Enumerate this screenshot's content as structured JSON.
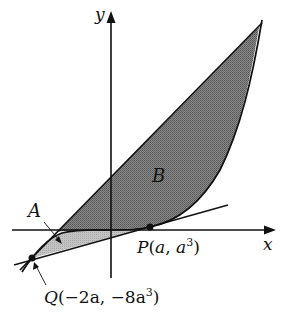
{
  "figure": {
    "axes": {
      "x_label": "x",
      "y_label": "y"
    },
    "regions": [
      {
        "label": "A",
        "shade": "#b8b8b8",
        "description": "region between tangent line and cubic curve"
      },
      {
        "label": "B",
        "shade": "#7a7a7a",
        "description": "region between line through Q and upper intersection and cubic curve"
      }
    ],
    "points": {
      "P": {
        "name": "P",
        "coords": "(a, a³)",
        "x": "a",
        "y": "a",
        "y_exp": "3"
      },
      "Q": {
        "name": "Q",
        "coords": "(−2a, −8a³)",
        "x": "−2a",
        "y": "−8a",
        "y_exp": "3"
      }
    },
    "curves": [
      {
        "type": "cubic",
        "equation": "y = x³"
      },
      {
        "type": "line",
        "role": "tangent at P"
      },
      {
        "type": "line",
        "role": "secant through Q"
      }
    ],
    "colors": {
      "stroke": "#111111",
      "region_A": "#b8b8b8",
      "region_B": "#7a7a7a"
    }
  }
}
